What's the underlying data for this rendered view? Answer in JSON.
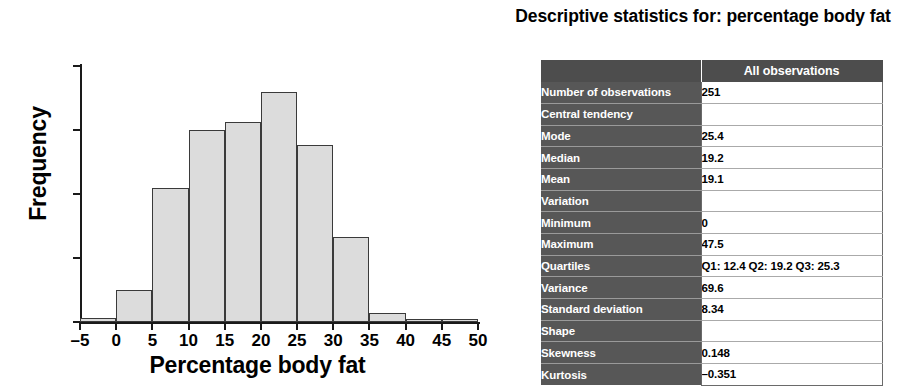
{
  "chart_data": {
    "type": "bar",
    "title": "",
    "xlabel": "Percentage body fat",
    "ylabel": "Frequency",
    "xlim": [
      -5,
      50
    ],
    "ylim": [
      0,
      60
    ],
    "xticks": [
      -5,
      0,
      5,
      10,
      15,
      20,
      25,
      30,
      35,
      40,
      45,
      50
    ],
    "xtick_labels": [
      "–5",
      "0",
      "5",
      "10",
      "15",
      "20",
      "25",
      "30",
      "35",
      "40",
      "45",
      "50"
    ],
    "yticks": [
      0,
      15,
      30,
      45,
      60
    ],
    "ytick_labels": [
      "0",
      "15",
      "30",
      "45",
      "60"
    ],
    "grid": false,
    "legend": null,
    "bin_width": 5,
    "bins": [
      {
        "start": -5,
        "end": 0,
        "value": 1
      },
      {
        "start": 0,
        "end": 5,
        "value": 7.5
      },
      {
        "start": 5,
        "end": 10,
        "value": 31.5
      },
      {
        "start": 10,
        "end": 15,
        "value": 45
      },
      {
        "start": 15,
        "end": 20,
        "value": 46.8
      },
      {
        "start": 20,
        "end": 25,
        "value": 54
      },
      {
        "start": 25,
        "end": 30,
        "value": 41.5
      },
      {
        "start": 30,
        "end": 35,
        "value": 20
      },
      {
        "start": 35,
        "end": 40,
        "value": 2
      },
      {
        "start": 40,
        "end": 45,
        "value": 0.6
      },
      {
        "start": 45,
        "end": 50,
        "value": 0.6
      }
    ],
    "categories": [
      "-5..0",
      "0..5",
      "5..10",
      "10..15",
      "15..20",
      "20..25",
      "25..30",
      "30..35",
      "35..40",
      "40..45",
      "45..50"
    ],
    "values": [
      1,
      7.5,
      31.5,
      45,
      46.8,
      54,
      41.5,
      20,
      2,
      0.6,
      0.6
    ]
  },
  "table": {
    "title": "Descriptive statistics for: percentage body fat",
    "header": {
      "label_col": "",
      "value_col": "All observations"
    },
    "rows": [
      {
        "label": "Number of observations",
        "value": "251",
        "level": 0
      },
      {
        "label": "Central tendency",
        "value": "",
        "level": 1
      },
      {
        "label": "Mode",
        "value": "25.4",
        "level": 2
      },
      {
        "label": "Median",
        "value": "19.2",
        "level": 2
      },
      {
        "label": "Mean",
        "value": "19.1",
        "level": 2
      },
      {
        "label": "Variation",
        "value": "",
        "level": 1
      },
      {
        "label": "Minimum",
        "value": "0",
        "level": 2
      },
      {
        "label": "Maximum",
        "value": "47.5",
        "level": 2
      },
      {
        "label": "Quartiles",
        "value": "Q1: 12.4 Q2: 19.2 Q3: 25.3",
        "level": 2
      },
      {
        "label": "Variance",
        "value": "69.6",
        "level": 2
      },
      {
        "label": "Standard deviation",
        "value": "8.34",
        "level": 2
      },
      {
        "label": "Shape",
        "value": "",
        "level": 1
      },
      {
        "label": "Skewness",
        "value": "0.148",
        "level": 2
      },
      {
        "label": "Kurtosis",
        "value": "–0.351",
        "level": 2
      }
    ]
  },
  "colors": {
    "bar_fill": "#dcdcdc",
    "bar_stroke": "#3a3a3a",
    "table_header_bg": "#4d4d4d",
    "table_label_bg": "#575757",
    "table_value_bg": "#ffffff",
    "axis": "#1a1a1a"
  }
}
